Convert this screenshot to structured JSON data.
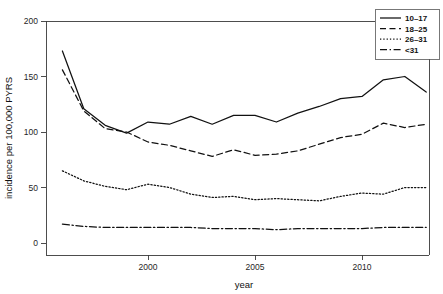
{
  "chart_data": {
    "type": "line",
    "title": "",
    "xlabel": "year",
    "ylabel": "incidence per 100,000 PYRS",
    "xlim": [
      1996,
      2013
    ],
    "ylim": [
      0,
      200
    ],
    "xticks": [
      2000,
      2005,
      2010
    ],
    "xtick_labels": [
      "2000",
      "2005",
      "2010"
    ],
    "yticks": [
      0,
      50,
      100,
      150,
      200
    ],
    "ytick_labels": [
      "0",
      "50",
      "100",
      "150",
      "200"
    ],
    "grid": false,
    "legend_position": "top-right",
    "x": [
      1996,
      1997,
      1998,
      1999,
      2000,
      2001,
      2002,
      2003,
      2004,
      2005,
      2006,
      2007,
      2008,
      2009,
      2010,
      2011,
      2012,
      2013
    ],
    "series": [
      {
        "name": "10-17",
        "label": "10–17",
        "dash": "solid",
        "dasharray": "none",
        "color": "#111111",
        "values": [
          173,
          121,
          106,
          99,
          109,
          107,
          114,
          107,
          115,
          115,
          109,
          117,
          123,
          130,
          132,
          147,
          150,
          136
        ]
      },
      {
        "name": "18-25",
        "label": "18–25",
        "dash": "dashed",
        "dasharray": "6,3.5",
        "color": "#111111",
        "values": [
          156,
          119,
          103,
          100,
          91,
          88,
          83,
          78,
          84,
          79,
          80,
          83,
          89,
          95,
          98,
          108,
          104,
          107
        ]
      },
      {
        "name": "26-31",
        "label": "26–31",
        "dash": "dotted",
        "dasharray": "1.3,2.0",
        "color": "#111111",
        "values": [
          65,
          56,
          51,
          48,
          53,
          50,
          44,
          41,
          42,
          39,
          40,
          39,
          38,
          42,
          45,
          44,
          50,
          50
        ]
      },
      {
        "name": "<31",
        "label": "<31",
        "dash": "dashdot",
        "dasharray": "7,2.6,1.4,2.6",
        "color": "#111111",
        "values": [
          17,
          15,
          14,
          14,
          14,
          14,
          14,
          13,
          13,
          13,
          12,
          13,
          13,
          13,
          13,
          14,
          14,
          14
        ]
      }
    ]
  },
  "figure": {
    "background_color": "#ffffff",
    "foreground_color": "#111111"
  }
}
